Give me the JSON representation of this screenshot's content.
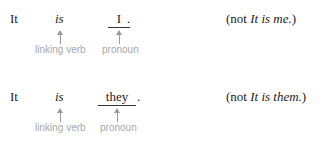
{
  "examples": [
    {
      "subject": "It",
      "verb": "is",
      "complement": "I",
      "end_punct": ".",
      "verb_label": "linking verb",
      "complement_label": "pronoun",
      "note_open": "(not ",
      "note_italic": "It is me.",
      "note_close": ")"
    },
    {
      "subject": "It",
      "verb": "is",
      "complement": "they",
      "end_punct": ".",
      "verb_label": "linking verb",
      "complement_label": "pronoun",
      "note_open": "(not ",
      "note_italic": "It is them.",
      "note_close": ")"
    }
  ]
}
